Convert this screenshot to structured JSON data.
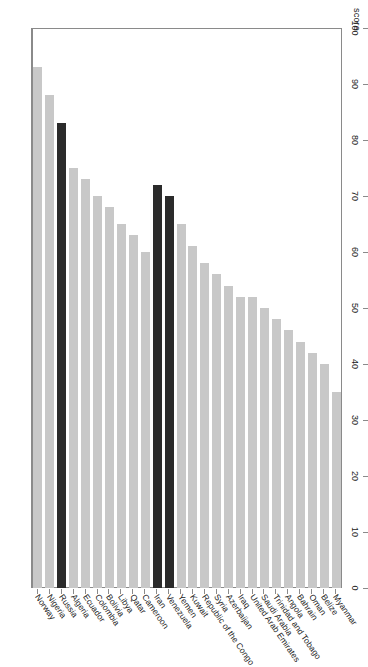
{
  "chart_data": {
    "type": "bar",
    "orientation": "horizontal",
    "title": "",
    "xlabel": "score",
    "ylabel": "",
    "xlim": [
      0,
      100
    ],
    "grid": false,
    "legend": null,
    "axis_title": "score",
    "tick_labels": [
      "0",
      "10",
      "20",
      "30",
      "40",
      "50",
      "60",
      "70",
      "80",
      "90",
      "100"
    ],
    "tick_values": [
      0,
      10,
      20,
      30,
      40,
      50,
      60,
      70,
      80,
      90,
      100
    ],
    "categories": [
      "Norway",
      "Nigeria",
      "Russia",
      "Algeria",
      "Ecuador",
      "Colombia",
      "Bolivia",
      "Libya",
      "Qatar",
      "Cameroon",
      "Iran",
      "Venezuela",
      "Yemen",
      "Kuwait",
      "Republic of the Congo",
      "Syria",
      "Azerbaijan",
      "Iraq",
      "United Arab Emirates",
      "Saudi Arabia",
      "Trinidad and Tobago",
      "Angola",
      "Bahrain",
      "Oman",
      "Belize",
      "Myanmar"
    ],
    "values": [
      93,
      88,
      83,
      75,
      73,
      70,
      68,
      65,
      63,
      60,
      72,
      70,
      65,
      61,
      58,
      56,
      54,
      52,
      52,
      50,
      48,
      46,
      44,
      42,
      40,
      35
    ],
    "highlighted": [
      "Russia",
      "Iran",
      "Venezuela"
    ],
    "colors": {
      "bar": "#c8c8c8",
      "bar_highlight": "#2b2b2b",
      "axis": "#8a8a8a",
      "text": "#1a1a1a",
      "background": "#ffffff"
    }
  }
}
